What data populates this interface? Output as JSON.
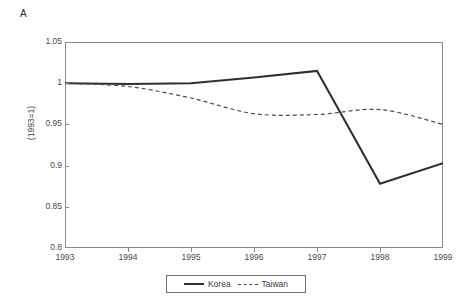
{
  "figure": {
    "panel_label": "A"
  },
  "chart_data": {
    "type": "line",
    "title": "",
    "subtitle": "",
    "xlabel": "",
    "ylabel": "(1993=1)",
    "x": [
      1993,
      1994,
      1995,
      1996,
      1997,
      1998,
      1999
    ],
    "xtick_labels": [
      "1993",
      "1994",
      "1995",
      "1996",
      "1997",
      "1998",
      "1999"
    ],
    "xlim": [
      1993,
      1999
    ],
    "ylim": [
      0.8,
      1.05
    ],
    "ytick_values": [
      0.8,
      0.85,
      0.9,
      0.95,
      1,
      1.05
    ],
    "ytick_labels": [
      "0.8",
      "0.85",
      "0.9",
      "0.95",
      "1",
      "1.05"
    ],
    "grid": false,
    "legend_position": "below-plot",
    "series": [
      {
        "name": "Korea",
        "style": "solid",
        "color": "#2f2f2f",
        "values": [
          1.0,
          0.999,
          1.0,
          1.007,
          1.015,
          0.878,
          0.903
        ]
      },
      {
        "name": "Taiwan",
        "style": "dashed",
        "color": "#4a4a4a",
        "values": [
          1.0,
          0.996,
          0.982,
          0.963,
          0.962,
          0.968,
          0.95
        ]
      }
    ]
  }
}
